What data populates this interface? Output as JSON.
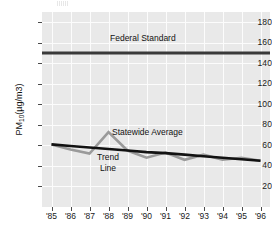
{
  "chart_data": {
    "type": "line",
    "title": "",
    "xlabel": "",
    "ylabel": "PM10 (µg/m3)",
    "ylabel_prefix": "PM",
    "ylabel_sub": "10",
    "ylabel_suffix": " (µg/m3)",
    "categories": [
      "'85",
      "'86",
      "'87",
      "'88",
      "'89",
      "'90",
      "'91",
      "'92",
      "'93",
      "'94",
      "'95",
      "'96"
    ],
    "yticks": [
      180,
      160,
      140,
      120,
      100,
      80,
      60,
      40,
      20
    ],
    "ylim": [
      0,
      190
    ],
    "grid": true,
    "legend_position": "inline-annotations",
    "series": [
      {
        "name": "Federal Standard",
        "type": "constant-line",
        "value": 150,
        "color": "#3a3a3a",
        "width": 3,
        "label": "Federal Standard"
      },
      {
        "name": "Statewide Average",
        "type": "line",
        "color": "#9a9a9a",
        "width": 2.6,
        "label": "Statewide Average",
        "values": [
          61,
          56,
          52,
          73,
          55,
          48,
          53,
          46,
          51,
          46,
          48,
          45
        ]
      },
      {
        "name": "Trend Line",
        "type": "line",
        "color": "#121212",
        "width": 2.6,
        "label": "Trend Line",
        "label_line1": "Trend",
        "label_line2": "Line",
        "values": [
          61,
          59.5,
          58,
          56.5,
          55,
          53.5,
          52.5,
          51,
          49.5,
          48,
          46.5,
          45
        ]
      }
    ],
    "colors": {
      "plot_background": "#e9e9e9",
      "gridline": "#fcfcfc",
      "axis": "#4a4a4a",
      "text": "#111111",
      "federal_standard": "#3a3a3a",
      "statewide_average": "#9a9a9a",
      "trend_line": "#121212"
    }
  },
  "annotations": {
    "federal_standard": "Federal Standard",
    "statewide_average": "Statewide Average",
    "trend_label_line1": "Trend",
    "trend_label_line2": "Line"
  }
}
